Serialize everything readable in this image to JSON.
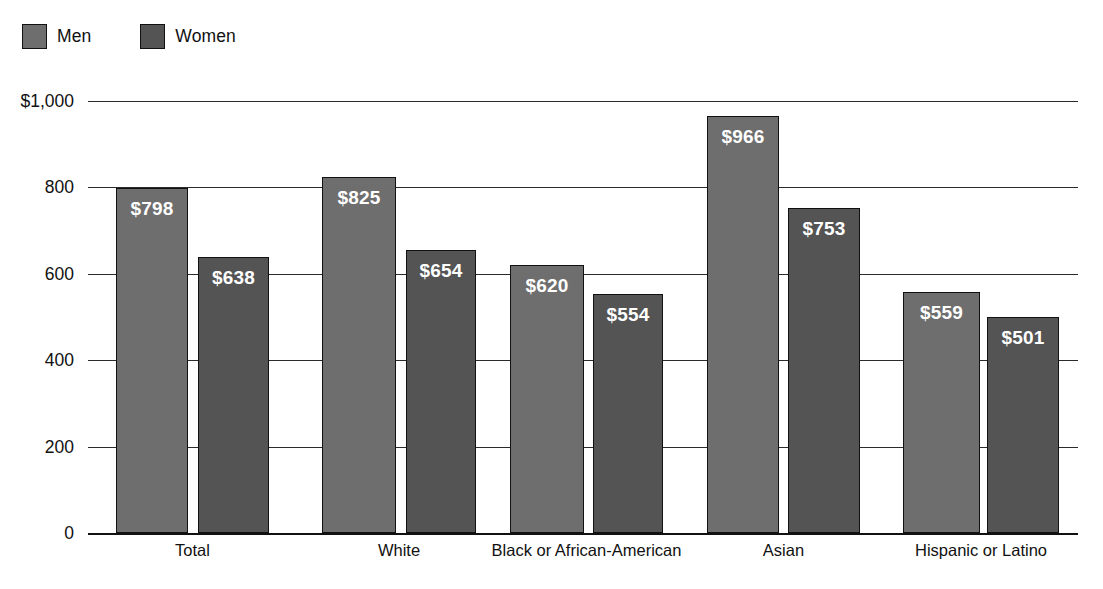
{
  "legend": {
    "entries": [
      {
        "label": "Men",
        "color": "#6e6e6e"
      },
      {
        "label": "Women",
        "color": "#545454"
      }
    ]
  },
  "axis": {
    "y_ticks": [
      {
        "label": "$1,000",
        "value": 1000
      },
      {
        "label": "800",
        "value": 800
      },
      {
        "label": "600",
        "value": 600
      },
      {
        "label": "400",
        "value": 400
      },
      {
        "label": "200",
        "value": 200
      },
      {
        "label": "0",
        "value": 0
      }
    ]
  },
  "chart_data": {
    "type": "bar",
    "title": "",
    "subtitle": "",
    "xlabel": "",
    "ylabel": "",
    "ylim": [
      0,
      1000
    ],
    "grid": true,
    "legend_position": "top-left",
    "categories": [
      "Total",
      "White",
      "Black or African-American",
      "Asian",
      "Hispanic or Latino"
    ],
    "series": [
      {
        "name": "Men",
        "color": "#6e6e6e",
        "values": [
          798,
          825,
          620,
          966,
          559
        ],
        "labels": [
          "$798",
          "$825",
          "$620",
          "$966",
          "$559"
        ]
      },
      {
        "name": "Women",
        "color": "#545454",
        "values": [
          638,
          654,
          554,
          753,
          501
        ],
        "labels": [
          "$638",
          "$654",
          "$554",
          "$753",
          "$501"
        ]
      }
    ],
    "value_prefix": "$",
    "axis_tick_labels": [
      "$1,000",
      "800",
      "600",
      "400",
      "200",
      "0"
    ]
  }
}
